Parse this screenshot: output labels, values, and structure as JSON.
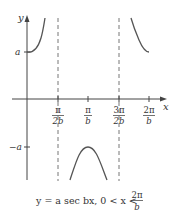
{
  "diagram": {
    "function": "y = a sec bx",
    "axes": {
      "x_label": "x",
      "y_label": "y"
    },
    "y_ticks": [
      {
        "label": "a",
        "value": "a"
      },
      {
        "label": "−a",
        "value": "-a"
      }
    ],
    "x_ticks": [
      {
        "num": "π",
        "den": "2b"
      },
      {
        "num": "π",
        "den": "b"
      },
      {
        "num": "3π",
        "den": "2b"
      },
      {
        "num": "2π",
        "den": "b"
      }
    ],
    "asymptotes": [
      "π/2b",
      "3π/2b"
    ],
    "caption": {
      "text": "y = a sec bx, 0 < x < ",
      "frac_num": "2π",
      "frac_den": "b"
    },
    "colors": {
      "curve": "#555555",
      "axis": "#444444",
      "dashed": "#777777"
    }
  }
}
